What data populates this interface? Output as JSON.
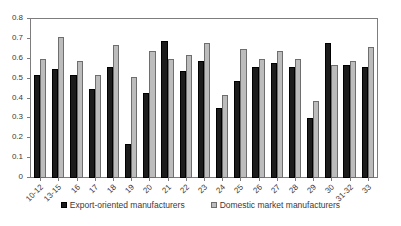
{
  "chart_data": {
    "type": "bar",
    "title": "",
    "xlabel": "",
    "ylabel": "",
    "ylim": [
      0,
      0.8
    ],
    "ytick_labels": [
      "0",
      "0.1",
      "0.2",
      "0.3",
      "0.4",
      "0.5",
      "0.6",
      "0.7",
      "0.8"
    ],
    "ytick_values": [
      0,
      0.1,
      0.2,
      0.3,
      0.4,
      0.5,
      0.6,
      0.7,
      0.8
    ],
    "grid": false,
    "legend_position": "bottom",
    "categories": [
      "10-12",
      "13-15",
      "16",
      "17",
      "18",
      "19",
      "20",
      "21",
      "22",
      "23",
      "24",
      "25",
      "26",
      "27",
      "28",
      "29",
      "30",
      "31-32",
      "33"
    ],
    "series": [
      {
        "name": "Export-oriented manufacturers",
        "color": "#1c1c1c",
        "values": [
          0.52,
          0.55,
          0.52,
          0.45,
          0.56,
          0.17,
          0.43,
          0.69,
          0.54,
          0.59,
          0.35,
          0.49,
          0.56,
          0.58,
          0.56,
          0.3,
          0.68,
          0.57,
          0.56
        ]
      },
      {
        "name": "Domestic market manufacturers",
        "color": "#bcbcbc",
        "values": [
          0.6,
          0.71,
          0.59,
          0.52,
          0.67,
          0.51,
          0.64,
          0.6,
          0.62,
          0.68,
          0.42,
          0.65,
          0.6,
          0.64,
          0.6,
          0.39,
          0.57,
          0.59,
          0.66
        ]
      }
    ]
  }
}
